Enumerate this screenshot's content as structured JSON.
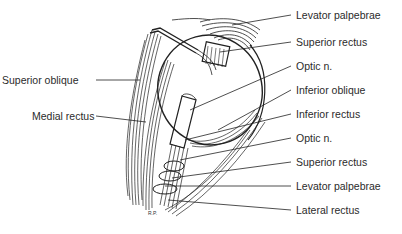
{
  "figure": {
    "signature": "R.P.",
    "labels_left": [
      {
        "id": "superior-oblique",
        "text": "Superior oblique"
      },
      {
        "id": "medial-rectus",
        "text": "Medial rectus"
      }
    ],
    "labels_right": [
      {
        "id": "levator-palpebrae-top",
        "text": "Levator palpebrae"
      },
      {
        "id": "superior-rectus-top",
        "text": "Superior rectus"
      },
      {
        "id": "optic-n-top",
        "text": "Optic n."
      },
      {
        "id": "inferior-oblique",
        "text": "Inferior oblique"
      },
      {
        "id": "inferior-rectus",
        "text": "Inferior rectus"
      },
      {
        "id": "optic-n-bottom",
        "text": "Optic n."
      },
      {
        "id": "superior-rectus-bottom",
        "text": "Superior rectus"
      },
      {
        "id": "levator-palpebrae-bottom",
        "text": "Levator palpebrae"
      },
      {
        "id": "lateral-rectus",
        "text": "Lateral rectus"
      }
    ]
  }
}
